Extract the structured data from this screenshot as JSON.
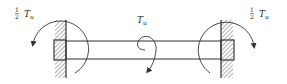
{
  "diagram": {
    "labels": {
      "left_reaction": {
        "coef_num": "1",
        "coef_den": "2",
        "symbol": "T",
        "subscript": "u"
      },
      "right_reaction": {
        "coef_num": "1",
        "coef_den": "2",
        "symbol": "T",
        "subscript": "u"
      },
      "applied_torque": {
        "symbol": "T",
        "subscript": "u"
      }
    },
    "colors": {
      "line": "#333333",
      "hatch": "#555555",
      "background": "#ffffff"
    }
  }
}
